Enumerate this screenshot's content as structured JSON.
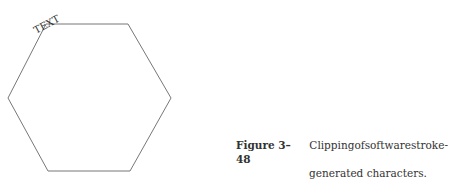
{
  "figure": {
    "label": "Figure 3–48",
    "caption_line1_words": [
      "Clipping",
      "of",
      "software",
      "stroke-"
    ],
    "caption_line2": "generated characters.",
    "caption_full": "Clipping of software stroke-generated characters.",
    "clipped_text": "TEXT",
    "shape": "hexagon",
    "stroke_color": "#777777"
  }
}
